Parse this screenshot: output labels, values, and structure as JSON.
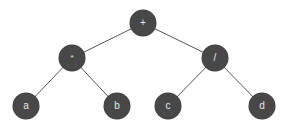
{
  "diagram": {
    "type": "expression-tree",
    "colors": {
      "node_fill": "#484848",
      "node_text": "#e8e8e8",
      "edge": "#555555",
      "background": "#ffffff"
    },
    "nodes": [
      {
        "id": "root",
        "label": "+",
        "x": 143,
        "y": 23
      },
      {
        "id": "mul",
        "label": "*",
        "x": 72,
        "y": 58
      },
      {
        "id": "div",
        "label": "/",
        "x": 215,
        "y": 58
      },
      {
        "id": "a",
        "label": "a",
        "x": 26,
        "y": 106
      },
      {
        "id": "b",
        "label": "b",
        "x": 117,
        "y": 106
      },
      {
        "id": "c",
        "label": "c",
        "x": 168,
        "y": 106
      },
      {
        "id": "d",
        "label": "d",
        "x": 262,
        "y": 106
      }
    ],
    "edges": [
      {
        "from": "root",
        "to": "mul"
      },
      {
        "from": "root",
        "to": "div"
      },
      {
        "from": "mul",
        "to": "a"
      },
      {
        "from": "mul",
        "to": "b"
      },
      {
        "from": "div",
        "to": "c"
      },
      {
        "from": "div",
        "to": "d"
      }
    ]
  }
}
